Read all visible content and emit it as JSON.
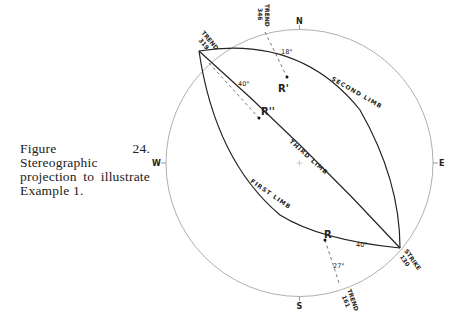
{
  "caption": {
    "text": "Figure 24. Stereographic projection to illustrate Example 1."
  },
  "diagram": {
    "type": "stereographic-projection",
    "directions": {
      "north": "N",
      "south": "S",
      "east": "E",
      "west": "W"
    },
    "limbs": {
      "first": "FIRST LIMB",
      "second": "SECOND LIMB",
      "third": "THIRD LIMB"
    },
    "points": {
      "r": "R",
      "r_prime": "R'",
      "r_double_prime": "R''"
    },
    "trends": {
      "t319": {
        "label": "TREND",
        "value": "319"
      },
      "t346": {
        "label": "TREND",
        "value": "346"
      },
      "t161": {
        "label": "TREND",
        "value": "161"
      }
    },
    "strike": {
      "label": "STRIKE",
      "value": "130"
    },
    "angles": {
      "r_prime_plunge": "18°",
      "r_double_prime_angle": "40°",
      "r_angle": "40°",
      "r_plunge": "27°"
    }
  }
}
